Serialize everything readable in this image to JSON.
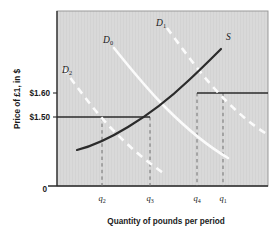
{
  "figure": {
    "background_color": "#ffffff",
    "plot_background_color": "#d7d7d7",
    "frame_color": "#8a8a8a"
  },
  "chart_data": {
    "type": "line",
    "title": "",
    "xlabel": "Quantity of pounds per period",
    "ylabel": "Price of £1, in $",
    "grid": false,
    "legend_position": "inline-curve-labels",
    "y_tick_labels": [
      "$1.60",
      "$1.50",
      "0"
    ],
    "y_tick_values": [
      1.6,
      1.5,
      0
    ],
    "x_tick_labels": [
      "q2",
      "q3",
      "q4",
      "q1"
    ],
    "x_tick_display": [
      {
        "base": "q",
        "sub": "2"
      },
      {
        "base": "q",
        "sub": "3"
      },
      {
        "base": "q",
        "sub": "4"
      },
      {
        "base": "q",
        "sub": "1"
      }
    ],
    "series": [
      {
        "name": "S",
        "label": "S",
        "role": "supply",
        "style": "solid",
        "color": "#2b2b2b",
        "slope": "upward",
        "points": [
          [
            0.1,
            1.425
          ],
          [
            0.2,
            1.447
          ],
          [
            0.32,
            1.475
          ],
          [
            0.44,
            1.505
          ],
          [
            0.56,
            1.545
          ],
          [
            0.66,
            1.585
          ],
          [
            0.76,
            1.632
          ],
          [
            0.84,
            1.672
          ]
        ]
      },
      {
        "name": "D0",
        "label": "D",
        "label_sub": "0",
        "role": "demand-initial",
        "style": "solid",
        "color": "#fbfbfb",
        "slope": "downward",
        "points": [
          [
            0.27,
            1.69
          ],
          [
            0.34,
            1.64
          ],
          [
            0.42,
            1.583
          ],
          [
            0.5,
            1.537
          ],
          [
            0.58,
            1.498
          ],
          [
            0.68,
            1.461
          ],
          [
            0.8,
            1.432
          ],
          [
            0.9,
            1.412
          ]
        ]
      },
      {
        "name": "D1",
        "label": "D",
        "label_sub": "1",
        "role": "demand-increased",
        "style": "dashed",
        "color": "#fbfbfb",
        "slope": "downward",
        "points": [
          [
            0.52,
            1.735
          ],
          [
            0.58,
            1.69
          ],
          [
            0.64,
            1.64
          ],
          [
            0.7,
            1.595
          ],
          [
            0.78,
            1.552
          ],
          [
            0.86,
            1.515
          ],
          [
            0.95,
            1.486
          ],
          [
            1.0,
            1.472
          ]
        ]
      },
      {
        "name": "D2",
        "label": "D",
        "label_sub": "2",
        "role": "demand-decreased",
        "style": "dashed",
        "color": "#fbfbfb",
        "slope": "downward",
        "points": [
          [
            0.04,
            1.64
          ],
          [
            0.11,
            1.585
          ],
          [
            0.19,
            1.53
          ],
          [
            0.28,
            1.48
          ],
          [
            0.38,
            1.435
          ],
          [
            0.48,
            1.397
          ],
          [
            0.58,
            1.368
          ],
          [
            0.66,
            1.35
          ]
        ]
      }
    ],
    "price_lines": [
      {
        "label": "$1.50",
        "value": 1.5,
        "from_x": 0.0,
        "to_x": 0.44,
        "color": "#2b2b2b"
      },
      {
        "label": "$1.60",
        "value": 1.6,
        "from_x": 0.665,
        "to_x": 1.0,
        "color": "#2b2b2b"
      }
    ],
    "quantity_drop_lines": [
      {
        "label": "q2",
        "x": 0.215,
        "to_y": 1.5
      },
      {
        "label": "q3",
        "x": 0.44,
        "to_y": 1.5
      },
      {
        "label": "q4",
        "x": 0.665,
        "to_y": 1.6
      },
      {
        "label": "q1",
        "x": 0.79,
        "to_y": 1.6
      }
    ],
    "annotations": [
      {
        "text": "S",
        "x": 0.845,
        "y": 1.69
      },
      {
        "text": "D0",
        "x": 0.255,
        "y": 1.718
      },
      {
        "text": "D1",
        "x": 0.52,
        "y": 1.76
      },
      {
        "text": "D2",
        "x": 0.055,
        "y": 1.672
      }
    ],
    "ylim": [
      1.3,
      1.78
    ],
    "xlim": [
      0,
      1
    ]
  }
}
